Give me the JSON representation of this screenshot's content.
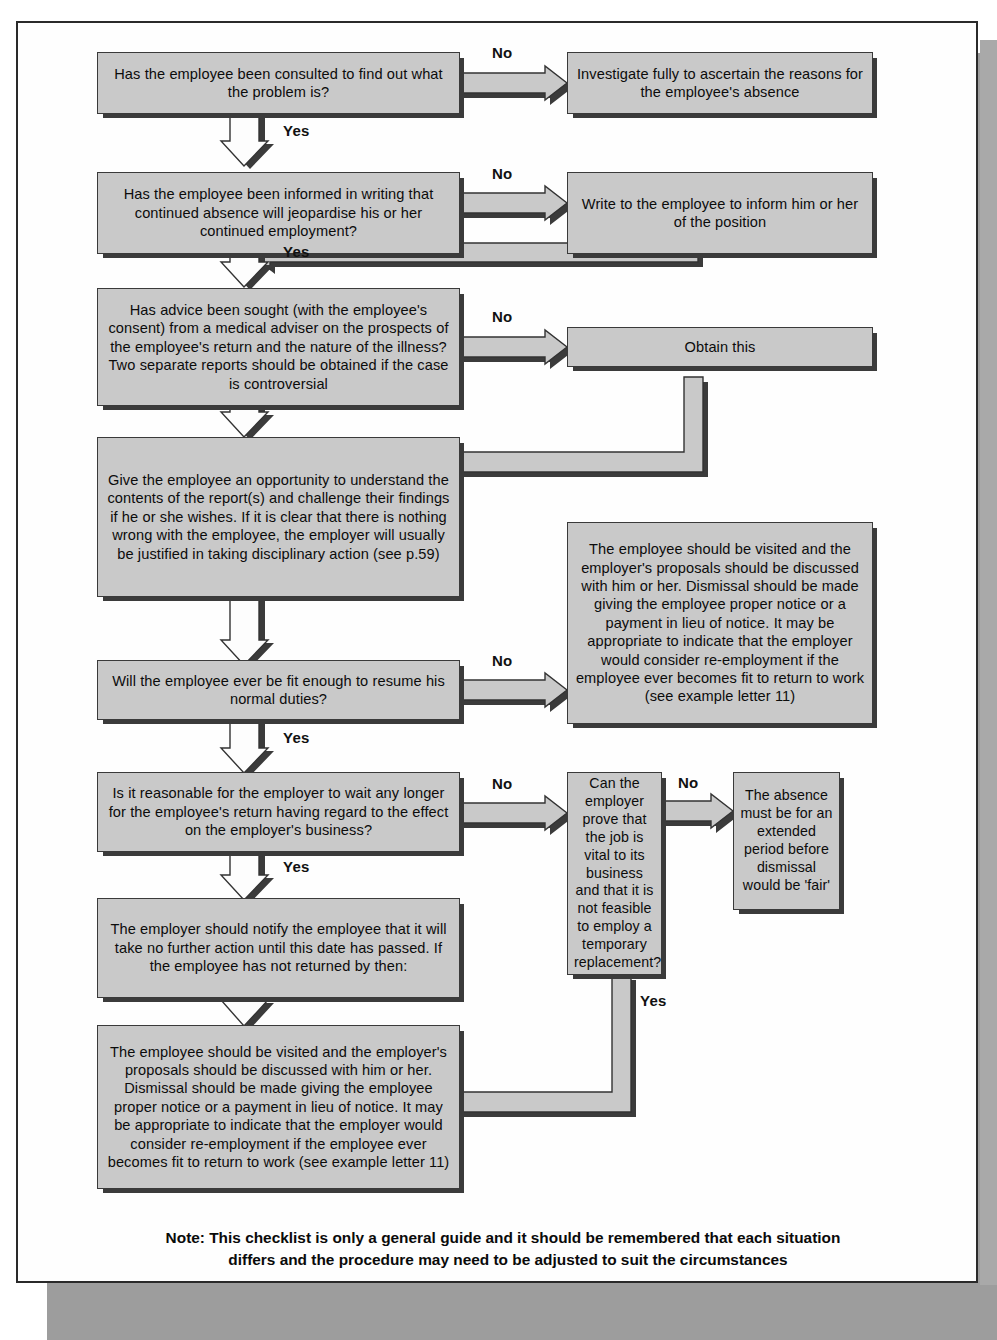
{
  "document": {
    "kind": "flowchart",
    "title": "Long-term sickness absence dismissal checklist"
  },
  "nodes": {
    "q1": "Has the employee been consulted to find out what the problem is?",
    "a1": "Investigate fully to ascertain the reasons for the employee's absence",
    "q2": "Has the employee been informed in writing that continued absence will jeopardise his or her continued employment?",
    "a2": "Write to the employee to inform him or her of the position",
    "q3": "Has advice been sought (with the employee's consent) from a medical adviser on the prospects of the employee's return and the nature of the illness? Two separate reports should be obtained if the case is controversial",
    "a3": "Obtain this",
    "p4": "Give the employee an opportunity to understand the contents of the report(s) and challenge their findings if he or she wishes. If it is clear that there is nothing wrong with the employee, the employer will usually be justified in taking disciplinary action (see p.59)",
    "q5": "Will the employee ever be fit enough to resume his normal duties?",
    "a5": "The employee should be visited and the employer's proposals should be discussed with him or her. Dismissal should be made giving the employee proper notice or a payment in lieu of notice. It may be appropriate to indicate that the employer would consider re-employment if the employee ever becomes fit to return to work (see example letter 11)",
    "q6": "Is it reasonable for the employer to wait any longer for the employee's return having regard to the effect on the employer's business?",
    "q7": "Can the employer prove that the job is vital to its business and that it is not feasible to employ a temporary replacement?",
    "a7": "The absence must be for an extended period before dismissal would be 'fair'",
    "p8": "The employer should notify the employee that it will take no further action until this date has passed. If the employee has not returned by then:",
    "p9": "The employee should be visited and the employer's proposals should be discussed with him or her. Dismissal should be made giving the employee proper notice or a payment in lieu of notice. It may be appropriate to indicate that the employer would consider re-employment if the employee ever becomes fit to return to work (see example letter 11)"
  },
  "edge_labels": {
    "no1": "No",
    "yes1": "Yes",
    "no2": "No",
    "yes2": "Yes",
    "no3": "No",
    "no5": "No",
    "yes5": "Yes",
    "no6": "No",
    "yes6": "Yes",
    "no7": "No",
    "yes7": "Yes"
  },
  "note": {
    "line1": "Note: This checklist is only a general guide and it should be remembered that each situation",
    "line2": "differs and the procedure may need to be adjusted to suit the circumstances"
  },
  "colors": {
    "box_fill": "#c9c9c9",
    "box_border": "#3a3a3a",
    "box_shadow": "#3b3b3b",
    "page_bg": "#fefefe",
    "page_border": "#2a2a2a",
    "page_shadow": "#9d9d9d",
    "text": "#0c0c0c",
    "connector_fill": "#c9c9c9",
    "connector_stroke": "#333333"
  }
}
